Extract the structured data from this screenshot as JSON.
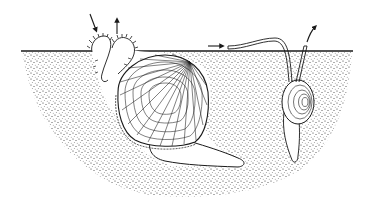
{
  "figure": {
    "description": "Line illustration of a cockle-like bivalve buried in sediment with siphons extended to the surface, and a snail buried beside it with its siphon/proboscis reaching the surface; arrows show water flow in and out",
    "colors": {
      "ink": "#1a1a1a",
      "background": "#ffffff",
      "sediment_dot": "#2a2a2a"
    },
    "elements": {
      "clam": "bivalve-shell",
      "clam_siphons": "siphons",
      "clam_foot": "foot",
      "snail": "snail-shell",
      "snail_siphon": "snail-siphon",
      "flow_arrows": [
        "inflow-arrow",
        "outflow-arrow",
        "snail-inflow-arrow",
        "snail-outflow-arrow"
      ]
    }
  }
}
